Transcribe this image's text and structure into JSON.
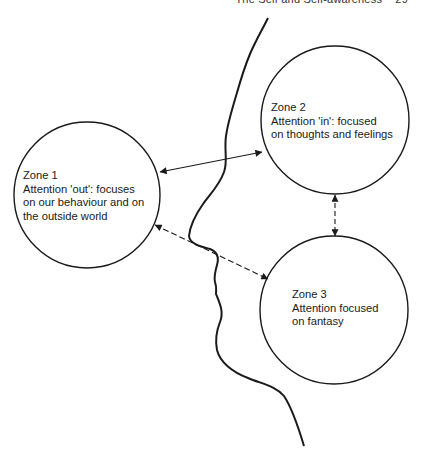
{
  "header": {
    "running_title": "The Self and Self-awareness",
    "page_number": "29"
  },
  "diagram": {
    "zones": [
      {
        "id": "zone1",
        "title": "Zone 1",
        "lines": [
          "Attention 'out': focuses",
          "on our behaviour and on",
          "the outside world"
        ],
        "center": [
          87,
          195
        ],
        "radius": 73
      },
      {
        "id": "zone2",
        "title": "Zone 2",
        "lines": [
          "Attention 'in': focused",
          "on thoughts and feelings"
        ],
        "center": [
          335,
          120
        ],
        "radius": 74
      },
      {
        "id": "zone3",
        "title": "Zone 3",
        "lines": [
          "Attention focused",
          "on fantasy"
        ],
        "center": [
          334,
          310
        ],
        "radius": 74
      }
    ],
    "connections": [
      {
        "from": "zone1",
        "to": "zone2",
        "style": "solid",
        "bidirectional": true
      },
      {
        "from": "zone1",
        "to": "zone3",
        "style": "dashed",
        "bidirectional": true
      },
      {
        "from": "zone2",
        "to": "zone3",
        "style": "dashed",
        "bidirectional": true
      }
    ],
    "profile_outline": "human face profile silhouette line",
    "colors": {
      "stroke": "#1a1a1a",
      "background": "#ffffff"
    }
  }
}
